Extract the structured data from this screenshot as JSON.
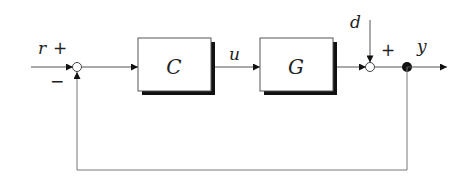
{
  "diagram": {
    "type": "feedback-control-block-diagram",
    "signals": {
      "reference": "r",
      "control": "u",
      "disturbance": "d",
      "output": "y"
    },
    "blocks": [
      {
        "id": "C",
        "label": "C",
        "role": "controller"
      },
      {
        "id": "G",
        "label": "G",
        "role": "plant"
      }
    ],
    "summing_junctions": [
      {
        "id": "sum1",
        "signs": {
          "reference": "+",
          "feedback": "−"
        }
      },
      {
        "id": "sum2",
        "signs": {
          "disturbance": "+"
        }
      }
    ],
    "edges": [
      {
        "from": "r",
        "to": "sum1"
      },
      {
        "from": "sum1",
        "to": "C"
      },
      {
        "from": "C",
        "to": "G",
        "label": "u"
      },
      {
        "from": "G",
        "to": "sum2"
      },
      {
        "from": "d",
        "to": "sum2"
      },
      {
        "from": "sum2",
        "to": "branch"
      },
      {
        "from": "branch",
        "to": "y"
      },
      {
        "from": "branch",
        "to": "sum1",
        "kind": "feedback"
      }
    ],
    "colors": {
      "line": "#444444",
      "shadow": "#111111",
      "box_fill": "#ffffff"
    }
  }
}
